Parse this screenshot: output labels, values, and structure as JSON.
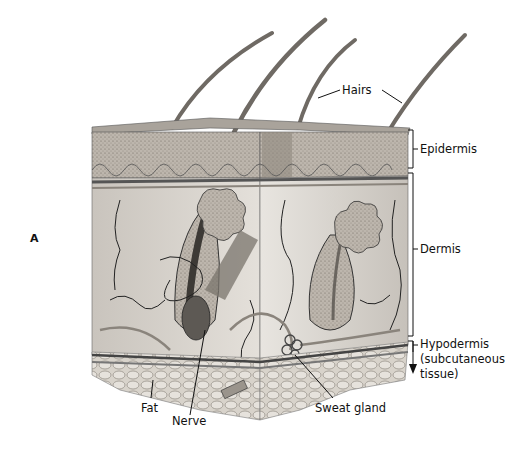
{
  "figure": {
    "panel_letter": "A",
    "labels": {
      "hairs": "Hairs",
      "epidermis": "Epidermis",
      "dermis": "Dermis",
      "hypodermis_line1": "Hypodermis",
      "hypodermis_line2": "(subcutaneous",
      "hypodermis_line3": "tissue)",
      "fat": "Fat",
      "nerve": "Nerve",
      "sweat_gland": "Sweat gland"
    },
    "colors": {
      "background": "#ffffff",
      "epidermis_fill": "#b7b0a8",
      "dermis_fill": "#dcd8d2",
      "fat_fill": "#cfcac2",
      "line": "#111111"
    }
  }
}
